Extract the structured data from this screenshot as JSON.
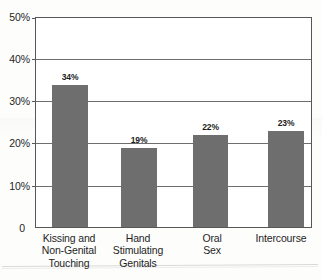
{
  "chart_data": {
    "type": "bar",
    "title": "",
    "subtitle": "",
    "xlabel": "",
    "ylabel": "",
    "categories": [
      "Kissing and Non-Genital Touching",
      "Hand Stimulating Genitals",
      "Oral Sex",
      "Intercourse"
    ],
    "category_lines": [
      [
        "Kissing and",
        "Non-Genital",
        "Touching"
      ],
      [
        "Hand",
        "Stimulating",
        "Genitals"
      ],
      [
        "Oral",
        "Sex"
      ],
      [
        "Intercourse"
      ]
    ],
    "values": [
      34,
      19,
      22,
      23
    ],
    "value_labels": [
      "34%",
      "19%",
      "22%",
      "23%"
    ],
    "ylim": [
      0,
      50
    ],
    "ytick_values": [
      50,
      40,
      30,
      20,
      10,
      0
    ],
    "ytick_labels": [
      "50%",
      "40%",
      "30%",
      "20%",
      "10%",
      "0"
    ],
    "grid": true,
    "grid_axis": "y",
    "legend": null,
    "legend_position": "none",
    "bar_color": "#6e6e6e",
    "axis_color": "#575757",
    "text_color": "#1f1f1f",
    "background_color": "#ffffff"
  }
}
